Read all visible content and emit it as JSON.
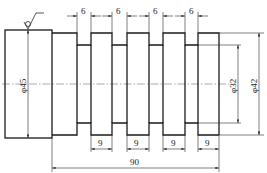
{
  "drawing": {
    "type": "shaft with grooves - technical drawing",
    "dimensions": {
      "groove_widths": [
        "6",
        "6",
        "6",
        "6"
      ],
      "land_widths": [
        "9",
        "9",
        "9",
        "9"
      ],
      "overall_length": "90",
      "large_diameter": "φ45",
      "groove_diameter": "φ32",
      "shaft_diameter": "φ42"
    },
    "surface_symbol": "roughness-check-icon"
  }
}
